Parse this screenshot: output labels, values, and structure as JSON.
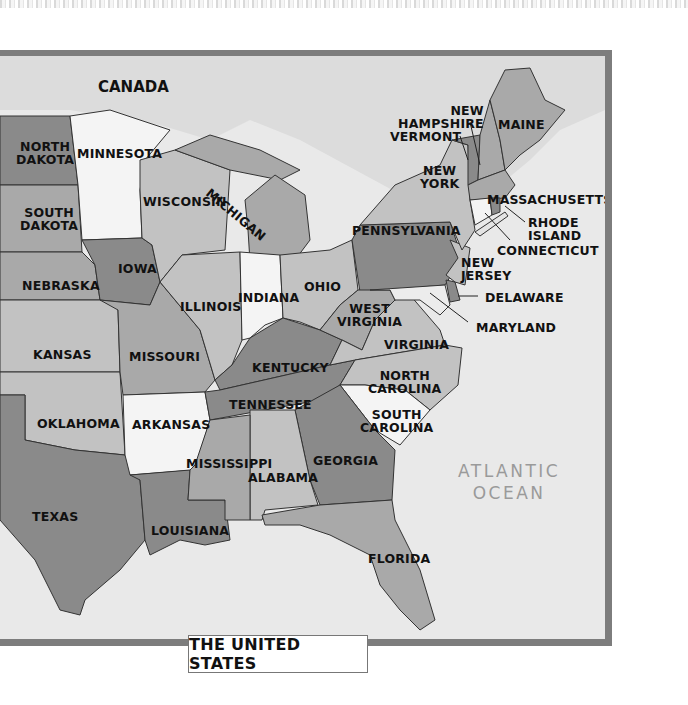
{
  "map": {
    "title": "THE UNITED STATES",
    "region_labels": {
      "canada": "CANADA",
      "ocean_line1": "ATLANTIC",
      "ocean_line2": "OCEAN"
    },
    "colors": {
      "frame": "#7d7d7d",
      "water": "#e9e9e9",
      "dark": "#8a8a8a",
      "medium": "#a9a9a9",
      "light": "#c2c2c2",
      "white": "#f4f4f4"
    },
    "states": [
      {
        "id": "north-dakota",
        "line1": "NORTH",
        "line2": "DAKOTA"
      },
      {
        "id": "minnesota",
        "line1": "MINNESOTA"
      },
      {
        "id": "michigan",
        "line1": "MICHIGAN"
      },
      {
        "id": "wisconsin",
        "line1": "WISCONSIN"
      },
      {
        "id": "south-dakota",
        "line1": "SOUTH",
        "line2": "DAKOTA"
      },
      {
        "id": "iowa",
        "line1": "IOWA"
      },
      {
        "id": "nebraska",
        "line1": "NEBRASKA"
      },
      {
        "id": "illinois",
        "line1": "ILLINOIS"
      },
      {
        "id": "indiana",
        "line1": "INDIANA"
      },
      {
        "id": "ohio",
        "line1": "OHIO"
      },
      {
        "id": "pennsylvania",
        "line1": "PENNSYLVANIA"
      },
      {
        "id": "new-york",
        "line1": "NEW",
        "line2": "YORK"
      },
      {
        "id": "new-hampshire",
        "line1": "NEW",
        "line2": "HAMPSHIRE"
      },
      {
        "id": "vermont",
        "line1": "VERMONT"
      },
      {
        "id": "maine",
        "line1": "MAINE"
      },
      {
        "id": "massachusetts",
        "line1": "MASSACHUSETTS"
      },
      {
        "id": "rhode-island",
        "line1": "RHODE",
        "line2": "ISLAND"
      },
      {
        "id": "connecticut",
        "line1": "CONNECTICUT"
      },
      {
        "id": "new-jersey",
        "line1": "NEW",
        "line2": "JERSEY"
      },
      {
        "id": "delaware",
        "line1": "DELAWARE"
      },
      {
        "id": "maryland",
        "line1": "MARYLAND"
      },
      {
        "id": "west-virginia",
        "line1": "WEST",
        "line2": "VIRGINIA"
      },
      {
        "id": "virginia",
        "line1": "VIRGINIA"
      },
      {
        "id": "kansas",
        "line1": "KANSAS"
      },
      {
        "id": "missouri",
        "line1": "MISSOURI"
      },
      {
        "id": "kentucky",
        "line1": "KENTUCKY"
      },
      {
        "id": "north-carolina",
        "line1": "NORTH",
        "line2": "CAROLINA"
      },
      {
        "id": "tennessee",
        "line1": "TENNESSEE"
      },
      {
        "id": "oklahoma",
        "line1": "OKLAHOMA"
      },
      {
        "id": "arkansas",
        "line1": "ARKANSAS"
      },
      {
        "id": "south-carolina",
        "line1": "SOUTH",
        "line2": "CAROLINA"
      },
      {
        "id": "mississippi",
        "line1": "MISSISSIPPI"
      },
      {
        "id": "alabama",
        "line1": "ALABAMA"
      },
      {
        "id": "georgia",
        "line1": "GEORGIA"
      },
      {
        "id": "texas",
        "line1": "TEXAS"
      },
      {
        "id": "louisiana",
        "line1": "LOUISIANA"
      },
      {
        "id": "florida",
        "line1": "FLORIDA"
      }
    ]
  }
}
